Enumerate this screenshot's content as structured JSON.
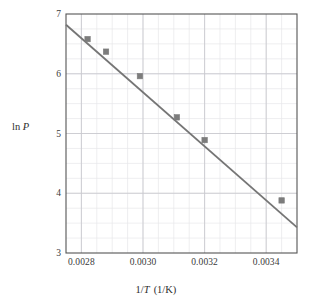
{
  "chart_data": {
    "type": "scatter",
    "title": "",
    "xlabel": "1/T  (1/K)",
    "ylabel": "ln P",
    "xlim": [
      0.00275,
      0.0035
    ],
    "ylim": [
      3,
      7
    ],
    "grid": true,
    "legend": "none",
    "xticks": [
      0.0028,
      0.003,
      0.0032,
      0.0034
    ],
    "xtick_labels": [
      "0.0028",
      "0.0030",
      "0.0032",
      "0.0034"
    ],
    "yticks": [
      3,
      4,
      5,
      6,
      7
    ],
    "ytick_labels": [
      "3",
      "4",
      "5",
      "6",
      "7"
    ],
    "x": [
      0.00282,
      0.00288,
      0.00299,
      0.00311,
      0.0032,
      0.00345
    ],
    "y": [
      6.58,
      6.37,
      5.96,
      5.27,
      4.89,
      3.88
    ],
    "series": [
      {
        "name": "data points",
        "marker": "square",
        "color": "#7c7c7c",
        "points": [
          {
            "x": 0.00282,
            "y": 6.58
          },
          {
            "x": 0.00288,
            "y": 6.37
          },
          {
            "x": 0.00299,
            "y": 5.96
          },
          {
            "x": 0.00311,
            "y": 5.27
          },
          {
            "x": 0.0032,
            "y": 4.89
          },
          {
            "x": 0.00345,
            "y": 3.88
          }
        ]
      },
      {
        "name": "best-fit line",
        "type": "line",
        "color": "#757575",
        "endpoints": [
          {
            "x": 0.00275,
            "y": 6.82
          },
          {
            "x": 0.0035,
            "y": 3.43
          }
        ]
      }
    ],
    "minor_grid_x_step": 5e-05,
    "minor_grid_y_step": 0.25,
    "axis_color": "#555555",
    "grid_color": "#c9c9cf",
    "minor_grid_color": "#e6e6ea"
  },
  "labels": {
    "y_axis_prefix": "ln",
    "y_axis_symbol": "P",
    "x_axis_prefix": "1/",
    "x_axis_symbol": "T",
    "x_axis_unit": "(1/K)"
  }
}
